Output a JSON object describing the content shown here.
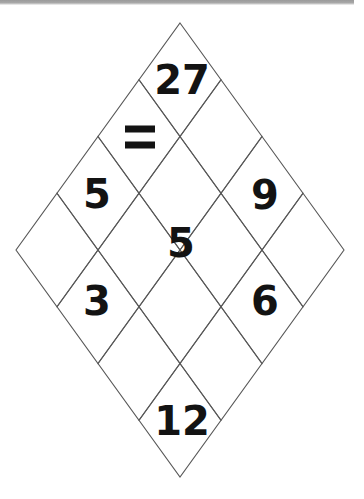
{
  "page": {
    "background_color": "#ffffff",
    "line_color": "#585858",
    "text_color": "#131313",
    "width": 364,
    "height": 499
  },
  "puzzle": {
    "shape": "diamond-lattice",
    "center_x": 180,
    "center_y": 250,
    "half_width": 164,
    "half_height": 227,
    "cell_half_width": 41,
    "cell_half_height": 56.75,
    "columns": 4,
    "rows": 4,
    "cells": [
      {
        "id": "top",
        "label": "27",
        "cx": 182,
        "cy": 80,
        "font_size": 40,
        "kind": "number"
      },
      {
        "id": "upper-left",
        "label": "=",
        "cx": 140,
        "cy": 137,
        "font_size": 40,
        "kind": "operator"
      },
      {
        "id": "left",
        "label": "5",
        "cx": 97,
        "cy": 194,
        "font_size": 40,
        "kind": "number"
      },
      {
        "id": "right",
        "label": "9",
        "cx": 265,
        "cy": 195,
        "font_size": 40,
        "kind": "number"
      },
      {
        "id": "center",
        "label": "5",
        "cx": 181,
        "cy": 243,
        "font_size": 40,
        "kind": "number"
      },
      {
        "id": "lower-left",
        "label": "3",
        "cx": 97,
        "cy": 301,
        "font_size": 40,
        "kind": "number"
      },
      {
        "id": "lower-right",
        "label": "6",
        "cx": 265,
        "cy": 301,
        "font_size": 40,
        "kind": "number"
      },
      {
        "id": "bottom",
        "label": "12",
        "cx": 182,
        "cy": 421,
        "font_size": 40,
        "kind": "number"
      }
    ]
  },
  "values": {
    "top": "27",
    "operator": "=",
    "left": "5",
    "right": "9",
    "center": "5",
    "lower_left": "3",
    "lower_right": "6",
    "bottom": "12"
  }
}
